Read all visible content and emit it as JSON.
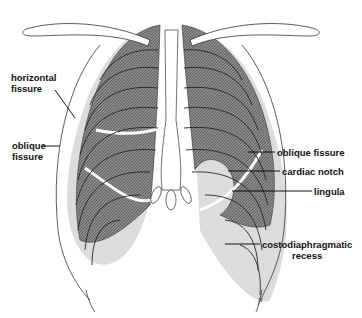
{
  "diagram": {
    "colors": {
      "lung_dark": "#7a7a7a",
      "lung_light": "#d9d9d9",
      "outline": "#222222",
      "background": "#ffffff"
    },
    "labels": {
      "horizontal_fissure": {
        "line1": "horizontal",
        "line2": "fissure"
      },
      "oblique_fissure_left": {
        "line1": "oblique",
        "line2": "fissure"
      },
      "oblique_fissure_right": "oblique fissure",
      "cardiac_notch": "cardiac notch",
      "lingula": "lingula",
      "costodiaphragmatic_recess": {
        "line1": "costodiaphragmatic",
        "line2": "recess"
      }
    },
    "signature": "N"
  }
}
